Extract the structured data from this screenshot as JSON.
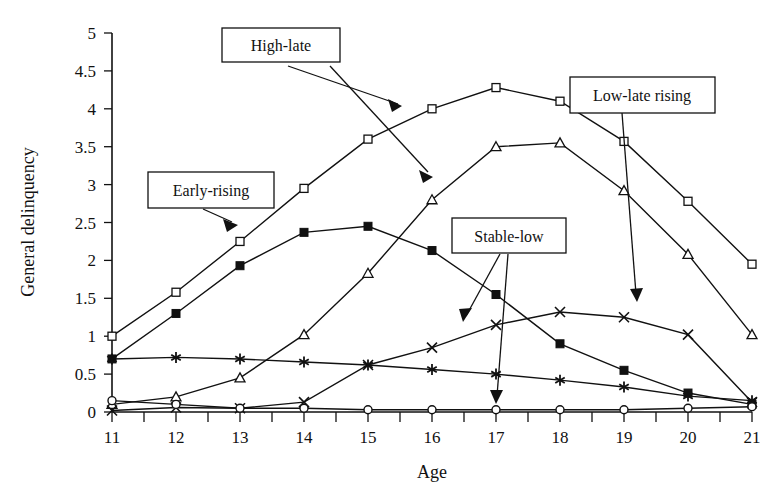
{
  "chart_data": {
    "type": "line",
    "title": "",
    "xlabel": "Age",
    "ylabel": "General delinquency",
    "x": [
      11,
      12,
      13,
      14,
      15,
      16,
      17,
      18,
      19,
      20,
      21
    ],
    "xtick_labels": [
      "11",
      "12",
      "13",
      "14",
      "15",
      "16",
      "17",
      "18",
      "19",
      "20",
      "21"
    ],
    "ytick_labels": [
      "0",
      "0.5",
      "1",
      "1.5",
      "2",
      "2.5",
      "3",
      "3.5",
      "4",
      "4.5",
      "5"
    ],
    "ytick_values": [
      0,
      0.5,
      1,
      1.5,
      2,
      2.5,
      3,
      3.5,
      4,
      4.5,
      5
    ],
    "xlim": [
      11,
      21
    ],
    "ylim": [
      0,
      5
    ],
    "grid": false,
    "legend_position": "callout-labels",
    "series": [
      {
        "name": "High-late",
        "marker": "open-square",
        "values": [
          1.0,
          1.58,
          2.25,
          2.95,
          3.6,
          4.0,
          4.28,
          4.1,
          3.57,
          2.78,
          1.95
        ]
      },
      {
        "name": "Early-rising",
        "marker": "filled-square",
        "values": [
          0.7,
          1.3,
          1.93,
          2.37,
          2.45,
          2.13,
          1.55,
          0.9,
          0.55,
          0.25,
          0.1
        ]
      },
      {
        "name": "Low-late rising",
        "marker": "open-triangle",
        "values": [
          0.1,
          0.2,
          0.45,
          1.02,
          1.83,
          2.8,
          3.5,
          3.55,
          2.92,
          2.08,
          1.02
        ]
      },
      {
        "name": "Stable-low",
        "marker": "asterisk",
        "values": [
          0.7,
          0.72,
          0.7,
          0.66,
          0.62,
          0.56,
          0.5,
          0.42,
          0.33,
          0.21,
          0.15
        ]
      },
      {
        "name": "X-series",
        "marker": "x-cross",
        "values": [
          0.02,
          0.06,
          0.05,
          0.13,
          0.62,
          0.85,
          1.15,
          1.32,
          1.25,
          1.02,
          0.13
        ]
      },
      {
        "name": "Circle-series",
        "marker": "open-circle",
        "values": [
          0.15,
          0.1,
          0.05,
          0.05,
          0.03,
          0.03,
          0.03,
          0.03,
          0.03,
          0.05,
          0.07
        ]
      }
    ],
    "annotations": [
      {
        "label": "High-late",
        "target_series": "High-late"
      },
      {
        "label": "Early-rising",
        "target_series": "Early-rising"
      },
      {
        "label": "Stable-low",
        "target_series": "Stable-low"
      },
      {
        "label": "Low-late rising",
        "target_series": "Low-late rising"
      }
    ]
  },
  "callouts": {
    "high_late": "High-late",
    "early_rising": "Early-rising",
    "stable_low": "Stable-low",
    "low_late_rising": "Low-late rising"
  },
  "axes": {
    "x_title": "Age",
    "y_title": "General delinquency"
  },
  "yticks": {
    "t0": "0",
    "t1": "0.5",
    "t2": "1",
    "t3": "1.5",
    "t4": "2",
    "t5": "2.5",
    "t6": "3",
    "t7": "3.5",
    "t8": "4",
    "t9": "4.5",
    "t10": "5"
  },
  "xticks": {
    "t0": "11",
    "t1": "12",
    "t2": "13",
    "t3": "14",
    "t4": "15",
    "t5": "16",
    "t6": "17",
    "t7": "18",
    "t8": "19",
    "t9": "20",
    "t10": "21"
  },
  "colors": {
    "ink": "#111111",
    "background": "#ffffff"
  }
}
